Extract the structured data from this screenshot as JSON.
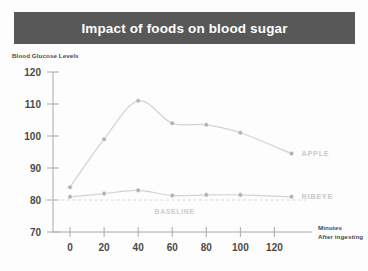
{
  "header": {
    "title": "Impact of foods on blood sugar"
  },
  "chart_data": {
    "type": "line",
    "title": "Impact of foods on blood sugar",
    "xlabel": "Minutes After Ingesting",
    "xlabel_line1": "Minutes",
    "xlabel_line2": "After ingesting",
    "ylabel": "Blood Glucose Levels",
    "xlim": [
      -10,
      135
    ],
    "ylim": [
      70,
      120
    ],
    "xticks": [
      0,
      20,
      40,
      60,
      80,
      100,
      120
    ],
    "yticks": [
      70,
      80,
      90,
      100,
      110,
      120
    ],
    "grid": false,
    "legend_position": "right-inline",
    "baseline": {
      "label": "BASELINE",
      "value": 80,
      "color": "#d9d9d9",
      "style": "dashed"
    },
    "series": [
      {
        "name": "APPLE",
        "label": "APPLE",
        "color": "#d2d2d2",
        "marker_color": "#b4b4b4",
        "x": [
          0,
          20,
          40,
          60,
          80,
          100,
          130
        ],
        "values": [
          84,
          99,
          111,
          104,
          103.5,
          101,
          94.5
        ]
      },
      {
        "name": "RIBEYE",
        "label": "RIBEYE",
        "color": "#d2d2d2",
        "marker_color": "#b4b4b4",
        "x": [
          0,
          20,
          40,
          60,
          80,
          100,
          130
        ],
        "values": [
          81,
          82,
          83,
          81.4,
          81.6,
          81.6,
          81
        ]
      }
    ]
  },
  "colors": {
    "banner": "#585858",
    "banner_text": "#ffffff",
    "axis": "#a8a8a8",
    "tick_text": "#4a4a4a",
    "series_line": "#d2d2d2",
    "series_marker": "#b4b4b4",
    "baseline": "#d9d9d9",
    "series_label": "#c9c9c9"
  }
}
